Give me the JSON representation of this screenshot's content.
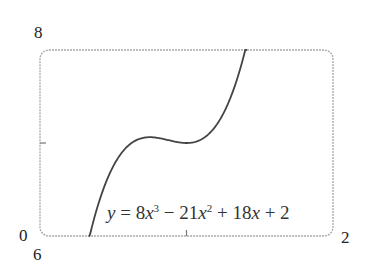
{
  "chart_data": {
    "type": "line",
    "title": "",
    "xlabel": "",
    "ylabel": "",
    "xlim": [
      0,
      2
    ],
    "ylim": [
      6,
      8
    ],
    "grid": false,
    "legend": "none",
    "function": "8x^3 - 21x^2 + 18x + 2",
    "annotation": "y = 8x³ − 21x² + 18x + 2",
    "x_ticks": [
      1
    ],
    "y_ticks": [
      7
    ],
    "corner_labels": {
      "x_min": "0",
      "x_max": "2",
      "y_min": "6",
      "y_max": "8"
    },
    "key_points": [
      {
        "label": "local max",
        "x": 0.75,
        "y": 7.0625
      },
      {
        "label": "local min",
        "x": 1.0,
        "y": 7.0
      }
    ],
    "series": [
      {
        "name": "y = 8x^3 - 21x^2 + 18x + 2",
        "x": [
          0.337,
          0.4,
          0.5,
          0.6,
          0.7,
          0.75,
          0.8,
          0.9,
          1.0,
          1.1,
          1.2,
          1.3,
          1.408
        ],
        "y": [
          6.0,
          6.272,
          6.75,
          6.968,
          7.054,
          7.0625,
          7.056,
          7.022,
          7.0,
          7.038,
          7.184,
          7.486,
          8.0
        ]
      }
    ],
    "colors": {
      "curve": "#444444",
      "frame": "#a8a8a8"
    }
  },
  "labels": {
    "y_max": "8",
    "x_min": "0",
    "y_min": "6",
    "x_max": "2"
  },
  "equation": {
    "lhs": "y",
    "eq": " = 8",
    "x1": "x",
    "p1": "3",
    "m1": " − 21",
    "x2": "x",
    "p2": "2",
    "m2": " + 18",
    "x3": "x",
    "m3": " + 2"
  }
}
